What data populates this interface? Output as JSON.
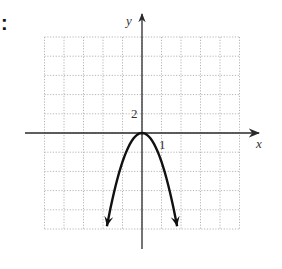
{
  "marker": ":",
  "chart_data": {
    "type": "line",
    "title": "",
    "function": "y = -3x^2",
    "xlabel": "x",
    "ylabel": "y",
    "x_tick_label": "1",
    "y_tick_label": "2",
    "x_unit_per_grid": 1,
    "y_unit_per_grid": 2,
    "grid": true,
    "grid_style": "dotted",
    "xlim": [
      -5,
      5
    ],
    "ylim": [
      -10,
      10
    ],
    "vertex": [
      0,
      0
    ],
    "opens": "down",
    "endpoints_with_arrows": [
      [
        -1.8,
        -9.7
      ],
      [
        1.8,
        -9.7
      ]
    ],
    "series": [
      {
        "name": "parabola",
        "x": [
          -1.8,
          -1.5,
          -1,
          -0.5,
          0,
          0.5,
          1,
          1.5,
          1.8
        ],
        "y": [
          -9.72,
          -6.75,
          -3,
          -0.75,
          0,
          -0.75,
          -3,
          -6.75,
          -9.72
        ]
      }
    ]
  },
  "colors": {
    "axis": "#2a2a2a",
    "grid": "#b5b5b5",
    "curve": "#111111",
    "text": "#333333"
  }
}
